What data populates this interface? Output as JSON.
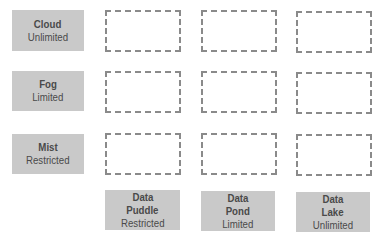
{
  "diagram": {
    "rows": [
      {
        "line1": "Cloud",
        "line2": "Unlimited"
      },
      {
        "line1": "Fog",
        "line2": "Limited"
      },
      {
        "line1": "Mist",
        "line2": "Restricted"
      }
    ],
    "columns": [
      {
        "line1": "Data",
        "line2": "Puddle",
        "line3": "Restricted"
      },
      {
        "line1": "Data",
        "line2": "Pond",
        "line3": "Limited"
      },
      {
        "line1": "Data",
        "line2": "Lake",
        "line3": "Unlimited"
      }
    ],
    "colors": {
      "label_fill": "#c9c9c9",
      "label_text": "#4a4a4a",
      "dashed_border": "#8a8a8a"
    }
  }
}
